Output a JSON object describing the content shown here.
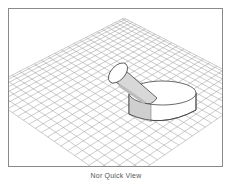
{
  "viewport": {
    "label": "3D model preview",
    "background": "#ffffff",
    "border_color": "#8a8a8a",
    "grid": {
      "line_color": "#a8a8a8",
      "apex": [
        123,
        17
      ],
      "left_corner": [
        -20,
        90
      ],
      "right_corner": [
        260,
        88
      ],
      "bottom_corner": [
        118,
        185
      ],
      "divisions": 24
    },
    "objects": [
      {
        "name": "disc-cylinder",
        "shape": "cylinder"
      },
      {
        "name": "angled-cylinder",
        "shape": "cylinder"
      }
    ]
  },
  "caption": {
    "text": "Nor Quick View"
  }
}
